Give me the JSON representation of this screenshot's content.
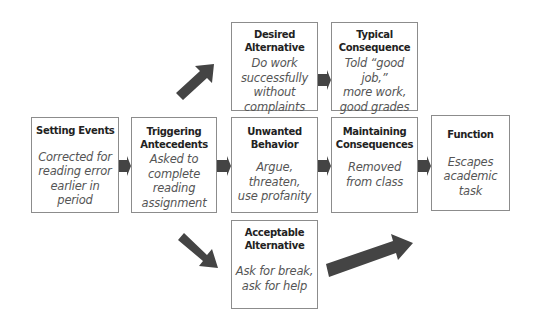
{
  "diagram": {
    "boxes": {
      "setting_events": {
        "title": "Setting Events",
        "body": [
          "Corrected for",
          "reading error",
          "earlier in period"
        ]
      },
      "triggering_antecedents": {
        "title": [
          "Triggering",
          "Antecedents"
        ],
        "body": [
          "Asked to",
          "complete",
          "reading",
          "assignment"
        ]
      },
      "unwanted_behavior": {
        "title": [
          "Unwanted",
          "Behavior"
        ],
        "body": [
          "Argue,",
          "threaten,",
          "use profanity"
        ]
      },
      "maintaining_consequences": {
        "title": [
          "Maintaining",
          "Consequences"
        ],
        "body": [
          "Removed",
          "from class"
        ]
      },
      "function": {
        "title": "Function",
        "body": [
          "Escapes",
          "academic task"
        ]
      },
      "desired_alternative": {
        "title": [
          "Desired",
          "Alternative"
        ],
        "body": [
          "Do work",
          "successfully",
          "without",
          "complaints"
        ]
      },
      "typical_consequence": {
        "title": [
          "Typical",
          "Consequence"
        ],
        "body": [
          "Told “good job,”",
          "more work,",
          "good grades"
        ]
      },
      "acceptable_alternative": {
        "title": [
          "Acceptable",
          "Alternative"
        ],
        "body": [
          "Ask for break,",
          "ask for help"
        ]
      }
    },
    "arrow_color": "#444444",
    "border_color": "#8c8c8c"
  }
}
